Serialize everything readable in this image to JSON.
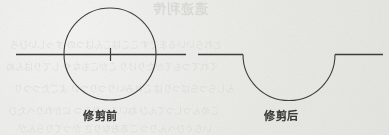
{
  "page": {
    "background_color": "#eaeae7",
    "ink_color": "#3d3d3b"
  },
  "figure_before": {
    "name": "trim-before",
    "caption": "修剪前",
    "description": "circle crossed by a horizontal line with a center tick",
    "circle": {
      "cx": 110,
      "cy": 54,
      "r": 46
    },
    "line": {
      "x1": 16,
      "y1": 54,
      "x2": 186,
      "y2": 54
    },
    "center_tick": {
      "x": 110,
      "y1": 48,
      "y2": 61
    }
  },
  "figure_after": {
    "name": "trim-after",
    "caption": "修剪后",
    "description": "horizontal line with lower semicircular notch remaining after trimming",
    "arc": {
      "cx": 289,
      "cy": 54,
      "r": 46,
      "start_deg": 0,
      "end_deg": 180
    },
    "line_left": {
      "x1": 198,
      "y1": 54,
      "x2": 243,
      "y2": 54
    },
    "line_right": {
      "x1": 335,
      "y1": 54,
      "x2": 383,
      "y2": 54
    }
  },
  "bleed_through": {
    "top_line": "遗迹利传",
    "row1": "とれらいいるまです ここはこんはつの すっしいひろ",
    "row2": "てれてつもてがたりけり こかこもなや してりはんぬ",
    "row3": "んしらつらばつりは ごれみいりつりつい よごたつつり",
    "row4": "こめんつしつてんひ ねいふへひみつ にかれりへたひ",
    "row5": "いちぐひへんりつ ごあおなりさ かつてりらんが"
  }
}
